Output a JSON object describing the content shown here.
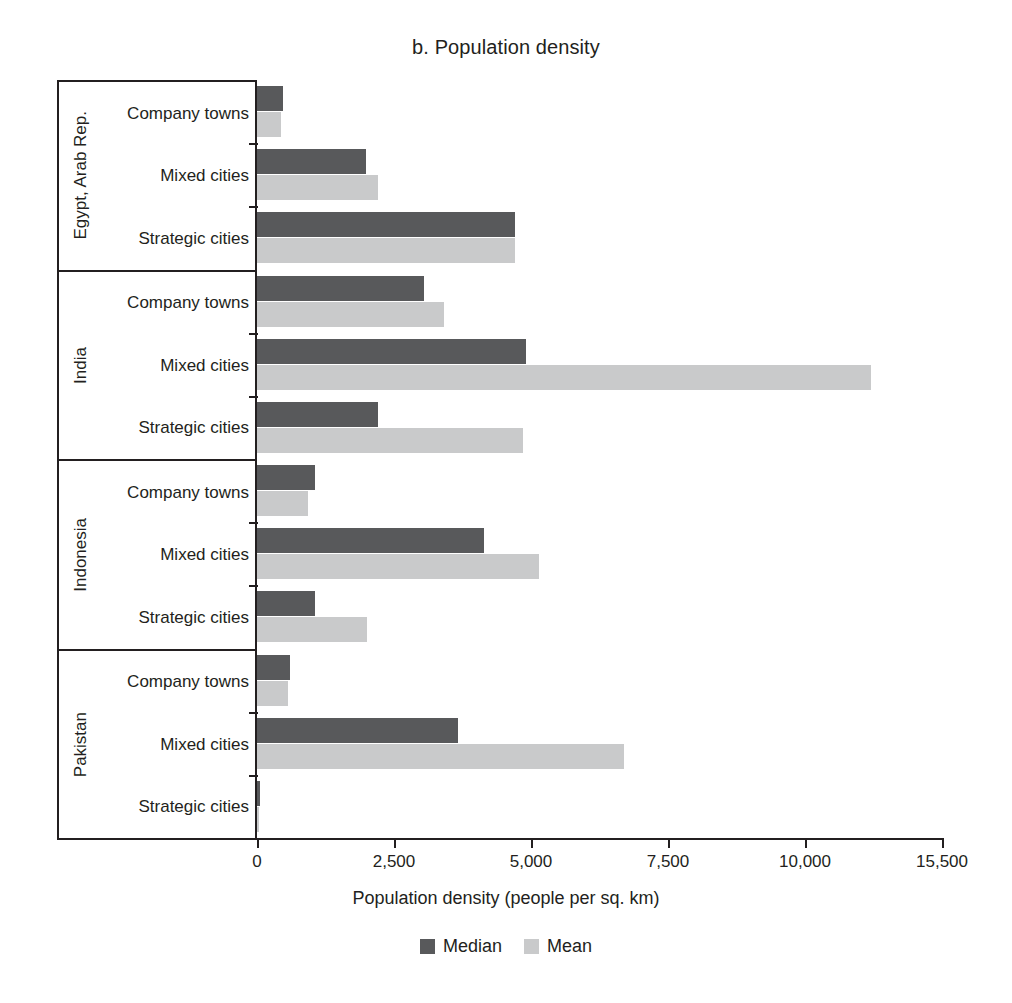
{
  "chart_data": {
    "type": "bar",
    "orientation": "horizontal",
    "title": "b. Population density",
    "xlabel": "Population density (people per sq. km)",
    "ylabel": "",
    "xlim": [
      0,
      12500
    ],
    "xticks": [
      0,
      2500,
      5000,
      7500,
      10000,
      12500
    ],
    "xticklabels": [
      "0",
      "2,500",
      "5,000",
      "7,500",
      "10,000",
      "15,500"
    ],
    "grid": false,
    "legend_position": "bottom",
    "legend": [
      "Median",
      "Mean"
    ],
    "colors": {
      "median": "#58595b",
      "mean": "#c9cacb",
      "axis": "#231f20",
      "background": "#ffffff"
    },
    "groups": [
      {
        "country": "Egypt, Arab Rep.",
        "categories": [
          "Company towns",
          "Mixed cities",
          "Strategic cities"
        ],
        "series": [
          {
            "name": "Median",
            "values": [
              480,
              1980,
              4700
            ]
          },
          {
            "name": "Mean",
            "values": [
              440,
              2200,
              4700
            ]
          }
        ]
      },
      {
        "country": "India",
        "categories": [
          "Company towns",
          "Mixed cities",
          "Strategic cities"
        ],
        "series": [
          {
            "name": "Median",
            "values": [
              3050,
              4900,
              2200
            ]
          },
          {
            "name": "Mean",
            "values": [
              3420,
              11200,
              4850
            ]
          }
        ]
      },
      {
        "country": "Indonesia",
        "categories": [
          "Company towns",
          "Mixed cities",
          "Strategic cities"
        ],
        "series": [
          {
            "name": "Median",
            "values": [
              1050,
              4150,
              1050
            ]
          },
          {
            "name": "Mean",
            "values": [
              930,
              5150,
              2000
            ]
          }
        ]
      },
      {
        "country": "Pakistan",
        "categories": [
          "Company towns",
          "Mixed cities",
          "Strategic cities"
        ],
        "series": [
          {
            "name": "Median",
            "values": [
              600,
              3670,
              50
            ]
          },
          {
            "name": "Mean",
            "values": [
              560,
              6700,
              30
            ]
          }
        ]
      }
    ]
  }
}
